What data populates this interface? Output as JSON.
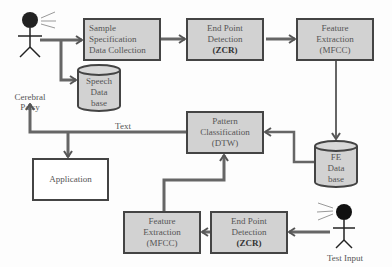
{
  "diagram": {
    "nodes": {
      "sample_spec": {
        "lines": [
          "Sample",
          "Specification",
          "Data Collection"
        ]
      },
      "epd_top": {
        "lines": [
          "End Point",
          "Detection"
        ],
        "bold": "(ZCR)"
      },
      "fe_top": {
        "lines": [
          "Feature",
          "Extraction",
          "(MFCC)"
        ]
      },
      "speech_db": {
        "lines": [
          "Speech",
          "Data",
          "base"
        ]
      },
      "fe_db": {
        "lines": [
          "FE",
          "Data",
          "base"
        ]
      },
      "pattern": {
        "lines": [
          "Pattern",
          "Classification",
          "(DTW)"
        ]
      },
      "application": {
        "label": "Application"
      },
      "fe_bottom": {
        "lines": [
          "Feature",
          "Extraction",
          "(MFCC)"
        ]
      },
      "epd_bottom": {
        "lines": [
          "End Point",
          "Detection"
        ],
        "bold": "(ZCR)"
      }
    },
    "labels": {
      "cerebral_palsy": [
        "Cerebral",
        "Palsy"
      ],
      "text": "Text",
      "test_input": "Test Input"
    },
    "colors": {
      "box_fill": "#d2d2d2",
      "stroke": "#444444",
      "arrow": "#555555"
    }
  }
}
